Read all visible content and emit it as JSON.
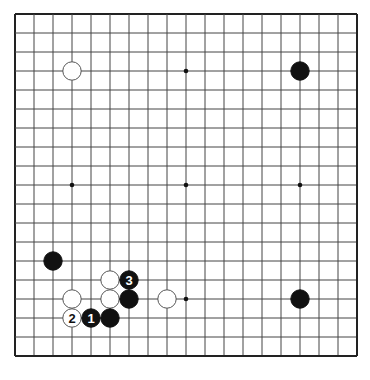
{
  "board": {
    "size": 19,
    "origin_x": 15,
    "origin_y": 14,
    "spacing": 19,
    "line_color": "#444444",
    "border_color": "#222222",
    "background": "#ffffff"
  },
  "star_points": [
    {
      "col": 3,
      "row": 3
    },
    {
      "col": 9,
      "row": 3
    },
    {
      "col": 15,
      "row": 3
    },
    {
      "col": 3,
      "row": 9
    },
    {
      "col": 9,
      "row": 9
    },
    {
      "col": 15,
      "row": 9
    },
    {
      "col": 3,
      "row": 15
    },
    {
      "col": 9,
      "row": 15
    },
    {
      "col": 15,
      "row": 15
    }
  ],
  "stones": [
    {
      "color": "white",
      "col": 3,
      "row": 3,
      "label": ""
    },
    {
      "color": "black",
      "col": 15,
      "row": 3,
      "label": ""
    },
    {
      "color": "black",
      "col": 2,
      "row": 13,
      "label": ""
    },
    {
      "color": "white",
      "col": 5,
      "row": 14,
      "label": ""
    },
    {
      "color": "black",
      "col": 6,
      "row": 14,
      "label": "3"
    },
    {
      "color": "white",
      "col": 3,
      "row": 15,
      "label": ""
    },
    {
      "color": "white",
      "col": 5,
      "row": 15,
      "label": ""
    },
    {
      "color": "black",
      "col": 6,
      "row": 15,
      "label": ""
    },
    {
      "color": "white",
      "col": 8,
      "row": 15,
      "label": ""
    },
    {
      "color": "black",
      "col": 15,
      "row": 15,
      "label": ""
    },
    {
      "color": "white",
      "col": 3,
      "row": 16,
      "label": "2"
    },
    {
      "color": "black",
      "col": 4,
      "row": 16,
      "label": "1"
    },
    {
      "color": "black",
      "col": 5,
      "row": 16,
      "label": ""
    }
  ],
  "move_sequence": [
    {
      "number": "1",
      "color": "black",
      "col": 4,
      "row": 16
    },
    {
      "number": "2",
      "color": "white",
      "col": 3,
      "row": 16
    },
    {
      "number": "3",
      "color": "black",
      "col": 6,
      "row": 14
    }
  ]
}
